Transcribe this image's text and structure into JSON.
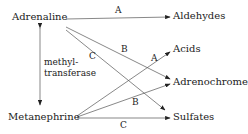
{
  "nodes": {
    "adrenaline": "Adrenaline",
    "metanephrine": "Metanephrine",
    "aldehydes": "Aldehydes",
    "acids": "Acids",
    "adrenochrome": "Adrenochrome",
    "sulfates": "Sulfates"
  },
  "enzyme": {
    "line1": "methyl-",
    "line2": "transferase"
  },
  "edges": [
    {
      "from": "Adrenaline",
      "to": "Aldehydes",
      "label": "A"
    },
    {
      "from": "Adrenaline",
      "to": "Adrenochrome",
      "label": "B"
    },
    {
      "from": "Adrenaline",
      "to": "Sulfates",
      "label": "C"
    },
    {
      "from": "Metanephrine",
      "to": "Acids",
      "label": "A"
    },
    {
      "from": "Metanephrine",
      "to": "Adrenochrome",
      "label": "B"
    },
    {
      "from": "Metanephrine",
      "to": "Sulfates",
      "label": "C"
    },
    {
      "from": "Adrenaline",
      "to": "Metanephrine",
      "label": "methyl-transferase",
      "bidirectional": true
    }
  ],
  "labels": {
    "a_top": "A",
    "b_top": "B",
    "c_top": "C",
    "a_bottom": "A",
    "b_bottom": "B",
    "c_bottom": "C"
  }
}
